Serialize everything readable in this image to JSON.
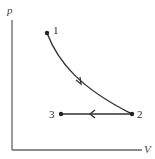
{
  "diagram": {
    "type": "pV-diagram",
    "axes": {
      "y_label": "p",
      "x_label": "V"
    },
    "points": [
      {
        "label": "1",
        "x": 47,
        "y": 33
      },
      {
        "label": "2",
        "x": 132,
        "y": 114
      },
      {
        "label": "3",
        "x": 61,
        "y": 114
      }
    ],
    "processes": [
      {
        "from": "1",
        "to": "2",
        "shape": "curve",
        "direction": "1 to 2"
      },
      {
        "from": "2",
        "to": "3",
        "shape": "straight horizontal",
        "direction": "2 to 3"
      }
    ],
    "colors": {
      "line": "#333333",
      "axis": "#555555"
    }
  }
}
